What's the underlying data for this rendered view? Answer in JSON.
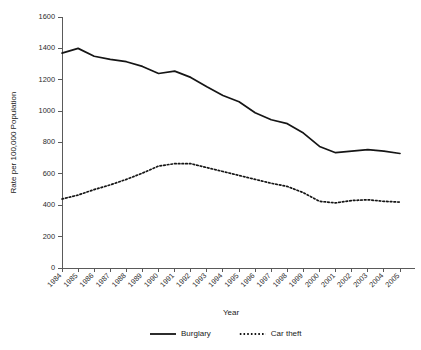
{
  "chart_data": {
    "type": "line",
    "title": "",
    "xlabel": "Year",
    "ylabel": "Rate per 100,000 Population",
    "grid": false,
    "legend_position": "bottom",
    "xlim": [
      1984,
      2005
    ],
    "ylim": [
      0,
      1600
    ],
    "yticks": [
      0,
      200,
      400,
      600,
      800,
      1000,
      1200,
      1400,
      1600
    ],
    "ytick_labels": [
      "0",
      "200",
      "400",
      "600",
      "800",
      "1000",
      "1200",
      "1400",
      "1600"
    ],
    "categories": [
      "1984",
      "1985",
      "1986",
      "1987",
      "1988",
      "1989",
      "1990",
      "1991",
      "1992",
      "1993",
      "1994",
      "1995",
      "1996",
      "1997",
      "1998",
      "1999",
      "2000",
      "2001",
      "2002",
      "2003",
      "2004",
      "2005"
    ],
    "series": [
      {
        "name": "Burglary",
        "style": "solid",
        "color": "#151515",
        "values": [
          1370,
          1400,
          1350,
          1330,
          1315,
          1285,
          1240,
          1255,
          1215,
          1155,
          1100,
          1060,
          990,
          945,
          920,
          860,
          775,
          735,
          745,
          755,
          745,
          730
        ]
      },
      {
        "name": "Car theft",
        "style": "dotted",
        "color": "#151515",
        "values": [
          440,
          465,
          500,
          530,
          565,
          605,
          650,
          665,
          665,
          640,
          615,
          590,
          565,
          540,
          520,
          480,
          425,
          415,
          430,
          435,
          425,
          420
        ]
      }
    ]
  },
  "legend": {
    "items": [
      {
        "label": "Burglary",
        "style": "solid"
      },
      {
        "label": "Car theft",
        "style": "dotted"
      }
    ]
  }
}
